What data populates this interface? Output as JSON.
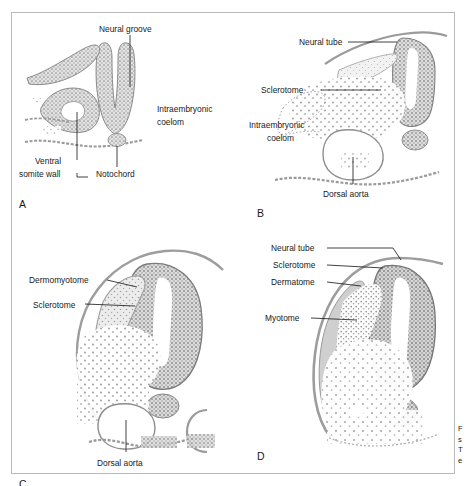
{
  "figure": {
    "type": "embryology-plate",
    "panel_count": 4,
    "border_color": "#b9b9b9",
    "tissue_color": "#9a9a9a",
    "fill_color": "#d8d8d8",
    "leader_color": "#111111",
    "background": "#ffffff"
  },
  "panels": [
    {
      "letter": "A",
      "name": "neural-groove-stage",
      "labels": [
        {
          "text": "Neural groove",
          "name": "label-neural-groove"
        },
        {
          "text": "Intraembryonic",
          "name": "label-intraembryonic-coelom-line1"
        },
        {
          "text": "coelom",
          "name": "label-intraembryonic-coelom-line2"
        },
        {
          "text": "Ventral",
          "name": "label-ventral-somite-wall-line1"
        },
        {
          "text": "somite wall",
          "name": "label-ventral-somite-wall-line2"
        },
        {
          "text": "Notochord",
          "name": "label-notochord"
        }
      ]
    },
    {
      "letter": "B",
      "name": "sclerotome-formation-stage",
      "labels": [
        {
          "text": "Neural tube",
          "name": "label-neural-tube"
        },
        {
          "text": "Sclerotome",
          "name": "label-sclerotome"
        },
        {
          "text": "Intraembryonic",
          "name": "label-intraembryonic-coelom-line1"
        },
        {
          "text": "coelom",
          "name": "label-intraembryonic-coelom-line2"
        },
        {
          "text": "Dorsal aorta",
          "name": "label-dorsal-aorta"
        }
      ]
    },
    {
      "letter": "C",
      "name": "dermomyotome-stage",
      "labels": [
        {
          "text": "Dermomyotome",
          "name": "label-dermomyotome"
        },
        {
          "text": "Sclerotome",
          "name": "label-sclerotome"
        },
        {
          "text": "Dorsal aorta",
          "name": "label-dorsal-aorta"
        }
      ]
    },
    {
      "letter": "D",
      "name": "dermatome-myotome-stage",
      "labels": [
        {
          "text": "Neural tube",
          "name": "label-neural-tube"
        },
        {
          "text": "Sclerotome",
          "name": "label-sclerotome"
        },
        {
          "text": "Dermatome",
          "name": "label-dermatome"
        },
        {
          "text": "Myotome",
          "name": "label-myotome"
        }
      ]
    }
  ],
  "caption_fragment": {
    "line1": "F",
    "line2": "s",
    "line3": "T",
    "line4": "e"
  }
}
